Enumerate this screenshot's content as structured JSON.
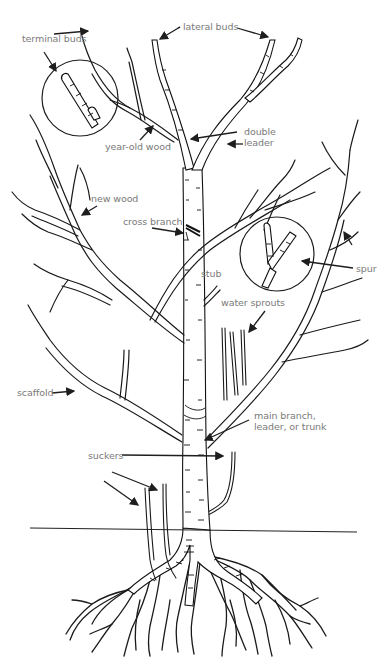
{
  "diagram": {
    "labels": [
      {
        "id": "terminal-buds",
        "text": "terminal buds",
        "x": 22,
        "y": 39
      },
      {
        "id": "lateral-buds",
        "text": "lateral buds",
        "x": 182,
        "y": 22
      },
      {
        "id": "year-old-wood",
        "text": "year-old wood",
        "x": 105,
        "y": 141
      },
      {
        "id": "double-leader",
        "text": "double\nleader",
        "x": 244,
        "y": 128
      },
      {
        "id": "new-wood",
        "text": "new wood",
        "x": 91,
        "y": 194
      },
      {
        "id": "cross-branch",
        "text": "cross branch",
        "x": 123,
        "y": 217
      },
      {
        "id": "stub",
        "text": "stub",
        "x": 201,
        "y": 269
      },
      {
        "id": "spur",
        "text": "spur",
        "x": 356,
        "y": 264
      },
      {
        "id": "water-sprouts",
        "text": "water sprouts",
        "x": 221,
        "y": 297
      },
      {
        "id": "scaffold",
        "text": "scaffold",
        "x": 17,
        "y": 385
      },
      {
        "id": "main-branch",
        "text": "main branch,\nleader, or trunk",
        "x": 254,
        "y": 410
      },
      {
        "id": "suckers",
        "text": "suckers",
        "x": 88,
        "y": 448
      }
    ],
    "arrows": [
      {
        "for": "terminal-buds",
        "from": [
          54,
          34
        ],
        "to": [
          88,
          31
        ]
      },
      {
        "for": "terminal-buds",
        "from": [
          44,
          52
        ],
        "to": [
          56,
          71
        ]
      },
      {
        "for": "lateral-buds",
        "from": [
          180,
          27
        ],
        "to": [
          160,
          39
        ]
      },
      {
        "for": "lateral-buds",
        "from": [
          237,
          28
        ],
        "to": [
          268,
          37
        ]
      },
      {
        "for": "year-old-wood",
        "from": [
          140,
          140
        ],
        "to": [
          153,
          126
        ]
      },
      {
        "for": "double-leader",
        "from": [
          237,
          132
        ],
        "to": [
          191,
          139
        ]
      },
      {
        "for": "double-leader",
        "from": [
          243,
          144
        ],
        "to": [
          228,
          144
        ]
      },
      {
        "for": "new-wood",
        "from": [
          97,
          206
        ],
        "to": [
          82,
          215
        ]
      },
      {
        "for": "cross-branch",
        "from": [
          152,
          228
        ],
        "to": [
          183,
          233
        ]
      },
      {
        "for": "spur",
        "from": [
          352,
          245
        ],
        "to": [
          344,
          232
        ]
      },
      {
        "for": "spur",
        "from": [
          353,
          268
        ],
        "to": [
          302,
          261
        ]
      },
      {
        "for": "water-sprouts",
        "from": [
          265,
          311
        ],
        "to": [
          249,
          332
        ]
      },
      {
        "for": "scaffold",
        "from": [
          52,
          393
        ],
        "to": [
          74,
          391
        ]
      },
      {
        "for": "main-branch",
        "from": [
          249,
          420
        ],
        "to": [
          205,
          440
        ]
      },
      {
        "for": "suckers",
        "from": [
          112,
          472
        ],
        "to": [
          157,
          490
        ]
      },
      {
        "for": "suckers",
        "from": [
          104,
          481
        ],
        "to": [
          138,
          505
        ]
      },
      {
        "for": "suckers",
        "from": [
          122,
          455
        ],
        "to": [
          223,
          456
        ]
      }
    ],
    "magnifier_circles": [
      {
        "for": "terminal-buds",
        "cx": 80,
        "cy": 98,
        "r": 38
      },
      {
        "for": "spur",
        "cx": 277,
        "cy": 254,
        "r": 37
      }
    ],
    "ground_line": {
      "x1": 30,
      "y1": 528,
      "x2": 357,
      "y2": 532
    }
  }
}
